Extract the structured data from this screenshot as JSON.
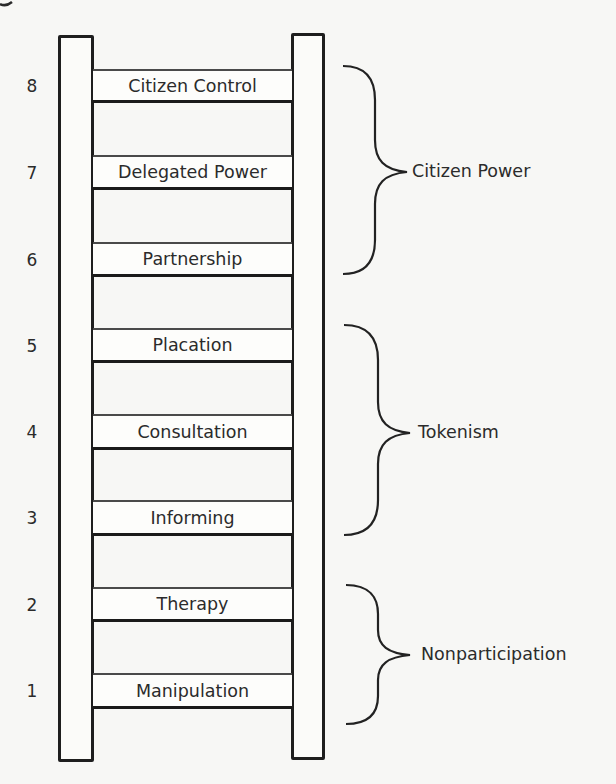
{
  "diagram": {
    "type": "ladder",
    "corner_glyph": "g",
    "rungs": [
      {
        "number": "8",
        "label": "Citizen Control",
        "top": 69,
        "bottom": 103
      },
      {
        "number": "7",
        "label": "Delegated Power",
        "top": 155,
        "bottom": 190
      },
      {
        "number": "6",
        "label": "Partnership",
        "top": 242,
        "bottom": 277
      },
      {
        "number": "5",
        "label": "Placation",
        "top": 328,
        "bottom": 363
      },
      {
        "number": "4",
        "label": "Consultation",
        "top": 414,
        "bottom": 450
      },
      {
        "number": "3",
        "label": "Informing",
        "top": 500,
        "bottom": 536
      },
      {
        "number": "2",
        "label": "Therapy",
        "top": 587,
        "bottom": 622
      },
      {
        "number": "1",
        "label": "Manipulation",
        "top": 673,
        "bottom": 709
      }
    ],
    "groups": [
      {
        "label": "Citizen Power",
        "rungs": [
          "8",
          "7",
          "6"
        ]
      },
      {
        "label": "Tokenism",
        "rungs": [
          "5",
          "4",
          "3"
        ]
      },
      {
        "label": "Nonparticipation",
        "rungs": [
          "2",
          "1"
        ]
      }
    ],
    "colors": {
      "background": "#f7f7f5",
      "stroke": "#1e1e1e",
      "text": "#2b2b2b"
    }
  }
}
